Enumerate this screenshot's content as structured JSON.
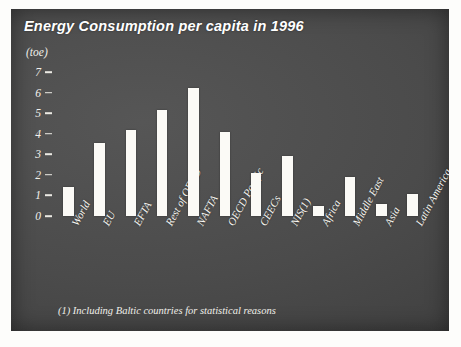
{
  "chart_data": {
    "type": "bar",
    "title": "Energy Consumption per capita in 1996",
    "unit_label": "(toe)",
    "xlabel": "",
    "ylabel": "toe",
    "ylim": [
      0,
      7.5
    ],
    "yticks": [
      0,
      1,
      2,
      3,
      4,
      5,
      6,
      7
    ],
    "grid": false,
    "legend": "none",
    "footnote": "(1) Including Baltic countries for statistical reasons",
    "categories": [
      "World",
      "EU",
      "EFTA",
      "Rest of OECD",
      "NAFTA",
      "OECD Pacific",
      "CEECs",
      "NIS(1)",
      "Africa",
      "Middle East",
      "Asia",
      "Latin America"
    ],
    "values": [
      1.4,
      3.55,
      4.2,
      5.15,
      6.25,
      4.1,
      2.1,
      2.9,
      0.5,
      1.9,
      0.6,
      1.05
    ],
    "bar_color": "#fbfaf6",
    "background_color": "#4a4a4a",
    "text_color": "#f4f3ee"
  }
}
